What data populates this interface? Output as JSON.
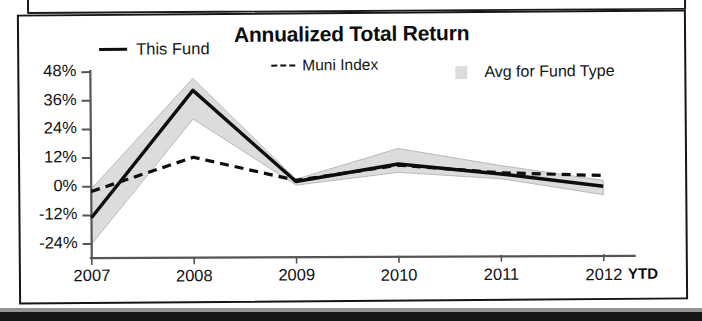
{
  "chart_data": {
    "type": "area",
    "title": "Annualized Total Return",
    "xlabel": "",
    "ylabel": "",
    "categories": [
      "2007",
      "2008",
      "2009",
      "2010",
      "2011",
      "2012"
    ],
    "x_axis_suffix": "YTD",
    "ylim": [
      -24,
      48
    ],
    "ytick_labels": [
      "48%",
      "36%",
      "24%",
      "12%",
      "0%",
      "-12%",
      "-24%"
    ],
    "ytick_values": [
      48,
      36,
      24,
      12,
      0,
      -12,
      -24
    ],
    "grid": false,
    "legend_position": "top",
    "series": [
      {
        "name": "This Fund",
        "style": "solid",
        "color": "#0d0d0d",
        "values": [
          -13,
          40,
          1.5,
          8.5,
          4,
          -1.5
        ]
      },
      {
        "name": "Muni Index",
        "style": "dashed",
        "color": "#0d0d0d",
        "values": [
          -2,
          12,
          2,
          8,
          4.5,
          3
        ]
      },
      {
        "name": "Avg for Fund Type",
        "style": "band",
        "color": "#dcdcdc",
        "upper": [
          -1,
          45,
          2.5,
          15,
          7.5,
          1
        ],
        "lower": [
          -24,
          28,
          0,
          5,
          2,
          -5
        ]
      }
    ]
  },
  "chart": {
    "title": "Annualized Total Return",
    "legend": [
      {
        "label": "This Fund",
        "marker": "solid-line-swatch"
      },
      {
        "label": "Muni Index",
        "marker": "dashed-line-swatch"
      },
      {
        "label": "Avg for Fund Type",
        "marker": "shaded-box-swatch"
      }
    ],
    "y_ticks": [
      "48%",
      "36%",
      "24%",
      "12%",
      "0%",
      "-12%",
      "-24%"
    ],
    "x_ticks": [
      "2007",
      "2008",
      "2009",
      "2010",
      "2011",
      "2012"
    ],
    "x_suffix": "YTD"
  },
  "colors": {
    "line": "#0d0d0d",
    "band": "#dcdcdc",
    "axis": "#555555",
    "frame": "#161616",
    "text": "#111111"
  }
}
